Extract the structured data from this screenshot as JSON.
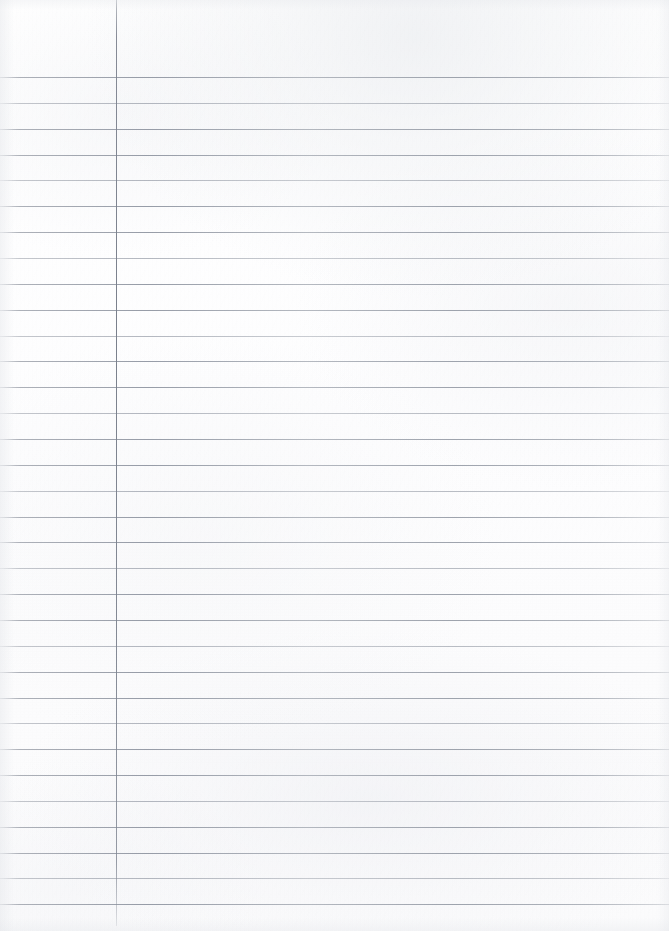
{
  "document": {
    "kind": "scanned-lined-notebook-page",
    "page_label": "",
    "written_content": "",
    "width_px": 669,
    "height_px": 931
  },
  "paper": {
    "background_color": "#fdfdfd",
    "texture": "subtle scan mottling, no handwriting, no print"
  },
  "ruling": {
    "line_color": "#8f95a0",
    "line_thickness_px": 1,
    "first_line_y": 77,
    "spacing_px": 25.8,
    "line_count": 33,
    "top_margin_px": 77,
    "lines_y": [
      77,
      103,
      129,
      155,
      180,
      206,
      232,
      258,
      284,
      310,
      336,
      361,
      387,
      413,
      439,
      465,
      491,
      517,
      542,
      568,
      594,
      620,
      646,
      672,
      698,
      723,
      749,
      775,
      801,
      827,
      853,
      878,
      904
    ]
  },
  "margin_rule": {
    "orientation": "vertical",
    "color": "#7e8490",
    "x_px": 116,
    "top_px": 0,
    "bottom_px": 926,
    "thickness_px": 1.4
  }
}
